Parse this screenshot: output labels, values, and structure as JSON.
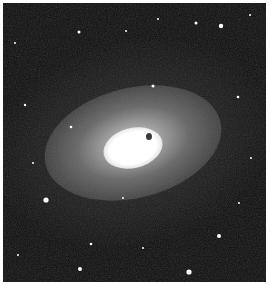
{
  "image": {
    "subject": "elliptical galaxy",
    "description": "Grayscale astronomical photograph of an elliptical galaxy with a bright white core, diffuse halo, and scattered foreground stars on a black sky",
    "colors": {
      "sky": "#0c0c0c",
      "core": "#ffffff",
      "halo": "#9a9a9a",
      "border": "#ffffff"
    }
  }
}
